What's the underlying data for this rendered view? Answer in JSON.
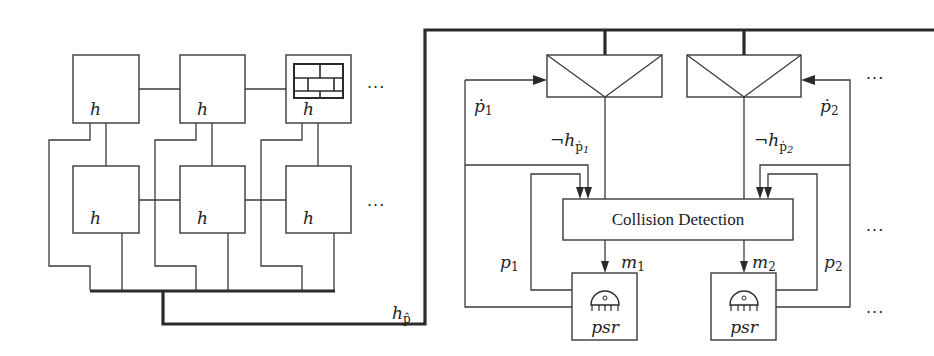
{
  "diagram": {
    "type": "block-diagram",
    "grid": {
      "cells": [
        {
          "row": 0,
          "col": 0,
          "label": "h"
        },
        {
          "row": 0,
          "col": 1,
          "label": "h"
        },
        {
          "row": 0,
          "col": 2,
          "label": "h",
          "icon": "brick-wall-icon"
        },
        {
          "row": 1,
          "col": 0,
          "label": "h"
        },
        {
          "row": 1,
          "col": 1,
          "label": "h"
        },
        {
          "row": 1,
          "col": 2,
          "label": "h"
        }
      ],
      "ellipsis": "···"
    },
    "bus_label": {
      "base": "h",
      "sub": "p̂"
    },
    "sensors": [
      {
        "id": "sensor-1",
        "input_label": {
          "base": "ṗ",
          "sub": "1"
        },
        "output_label": {
          "neg": "¬",
          "base": "h",
          "sub": "ṗ",
          "subsub": "1"
        }
      },
      {
        "id": "sensor-2",
        "input_label": {
          "base": "ṗ",
          "sub": "2"
        },
        "output_label": {
          "neg": "¬",
          "base": "h",
          "sub": "ṗ",
          "subsub": "2"
        }
      }
    ],
    "collision_detection": {
      "label": "Collision Detection"
    },
    "psr_units": [
      {
        "label": "psr",
        "move_label": {
          "base": "m",
          "sub": "1"
        },
        "position_label": {
          "base": "p",
          "sub": "1"
        }
      },
      {
        "label": "psr",
        "move_label": {
          "base": "m",
          "sub": "2"
        },
        "position_label": {
          "base": "p",
          "sub": "2"
        }
      }
    ],
    "right_ellipsis": "···"
  }
}
